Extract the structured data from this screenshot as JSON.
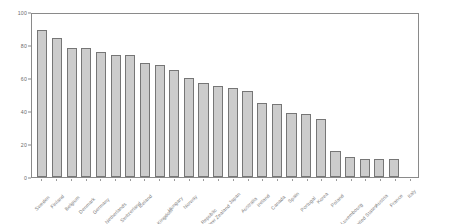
{
  "chart_data": {
    "type": "bar",
    "title": "",
    "subtitle": "",
    "xlabel": "",
    "ylabel": "",
    "ylim": [
      0,
      100
    ],
    "yticks": [
      0,
      20,
      40,
      60,
      80,
      100
    ],
    "grid": false,
    "legend": false,
    "bar_color": "#cccccc",
    "bar_edge_color": "#767676",
    "axis_color": "#8a8a8a",
    "tick_label_color": "#7d7d7d",
    "categories": [
      "Sweden",
      "Finland",
      "Belgium",
      "Denmark",
      "Germany",
      "Netherlands",
      "Switzerland",
      "Iceland",
      "United Kingdom",
      "Hungary",
      "Norway",
      "Czech Republic",
      "New Zealand",
      "Japan",
      "Australia",
      "Ireland",
      "Canada",
      "Spain",
      "Portugal",
      "Korea",
      "Poland",
      "Luxembourg",
      "United States",
      "Austria",
      "France",
      "Italy"
    ],
    "values": [
      89,
      84,
      78,
      78,
      76,
      74,
      74,
      69,
      68,
      65,
      60,
      57,
      55,
      54,
      52,
      45,
      44,
      39,
      38,
      35,
      16,
      12,
      11,
      11,
      11,
      0
    ]
  }
}
